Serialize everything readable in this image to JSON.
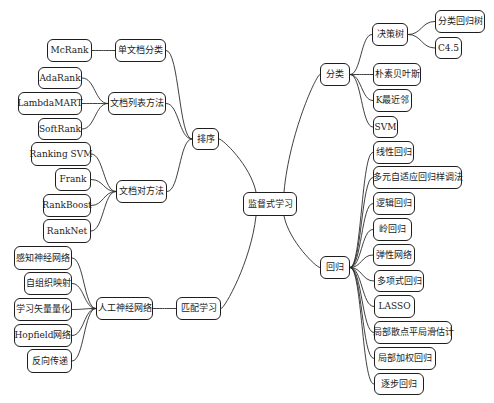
{
  "root": {
    "id": "root",
    "label": "监督式学习"
  },
  "nodes": [
    {
      "id": "sort",
      "label": "排序",
      "parent": "root"
    },
    {
      "id": "match",
      "label": "匹配学习",
      "parent": "root"
    },
    {
      "id": "classify",
      "label": "分类",
      "parent": "root"
    },
    {
      "id": "regress",
      "label": "回归",
      "parent": "root"
    },
    {
      "id": "single_doc",
      "label": "单文档分类",
      "parent": "sort"
    },
    {
      "id": "doc_list",
      "label": "文档列表方法",
      "parent": "sort"
    },
    {
      "id": "doc_pair",
      "label": "文档对方法",
      "parent": "sort"
    },
    {
      "id": "mcrank",
      "label": "McRank",
      "parent": "single_doc"
    },
    {
      "id": "adarank",
      "label": "AdaRank",
      "parent": "doc_list"
    },
    {
      "id": "lambdamart",
      "label": "LambdaMART",
      "parent": "doc_list"
    },
    {
      "id": "softrank",
      "label": "SoftRank",
      "parent": "doc_list"
    },
    {
      "id": "rankingsvm",
      "label": "Ranking SVM",
      "parent": "doc_pair"
    },
    {
      "id": "frank",
      "label": "Frank",
      "parent": "doc_pair"
    },
    {
      "id": "rankboost",
      "label": "RankBoost",
      "parent": "doc_pair"
    },
    {
      "id": "ranknet",
      "label": "RankNet",
      "parent": "doc_pair"
    },
    {
      "id": "ann",
      "label": "人工神经网络",
      "parent": "match"
    },
    {
      "id": "perceptron",
      "label": "感知神经网络",
      "parent": "ann"
    },
    {
      "id": "som",
      "label": "自组织映射",
      "parent": "ann"
    },
    {
      "id": "lvq",
      "label": "学习矢量量化",
      "parent": "ann"
    },
    {
      "id": "hopfield",
      "label": "Hopfield网络",
      "parent": "ann"
    },
    {
      "id": "backprop",
      "label": "反向传递",
      "parent": "ann"
    },
    {
      "id": "dtree",
      "label": "决策树",
      "parent": "classify"
    },
    {
      "id": "cart",
      "label": "分类回归树",
      "parent": "dtree"
    },
    {
      "id": "c45",
      "label": "C4.5",
      "parent": "dtree"
    },
    {
      "id": "naive_bayes",
      "label": "朴素贝叶斯",
      "parent": "classify"
    },
    {
      "id": "knn",
      "label": "K最近邻",
      "parent": "classify"
    },
    {
      "id": "svm",
      "label": "SVM",
      "parent": "classify"
    },
    {
      "id": "linear",
      "label": "线性回归",
      "parent": "regress"
    },
    {
      "id": "mars",
      "label": "多元自适应回归样调法",
      "parent": "regress"
    },
    {
      "id": "logistic",
      "label": "逻辑回归",
      "parent": "regress"
    },
    {
      "id": "ridge",
      "label": "岭回归",
      "parent": "regress"
    },
    {
      "id": "elastic",
      "label": "弹性网络",
      "parent": "regress"
    },
    {
      "id": "poly",
      "label": "多项式回归",
      "parent": "regress"
    },
    {
      "id": "lasso",
      "label": "LASSO",
      "parent": "regress"
    },
    {
      "id": "loess",
      "label": "局部散点平局滑估计",
      "parent": "regress"
    },
    {
      "id": "lwr",
      "label": "局部加权回归",
      "parent": "regress"
    },
    {
      "id": "stepwise",
      "label": "逐步回归",
      "parent": "regress"
    }
  ]
}
